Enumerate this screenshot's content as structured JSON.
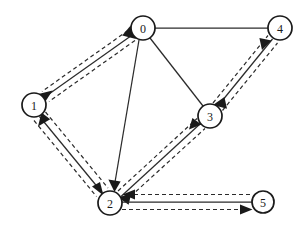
{
  "figure": {
    "type": "directed-graph-diagram",
    "background_color": "#ffffff",
    "line_color": "#2b2b2b",
    "node_fill_color": "#ffffff",
    "node_stroke_color": "#1a1a1a"
  },
  "nodes": [
    {
      "id": "0",
      "label": "0",
      "cx": 143,
      "cy": 28,
      "r": 12
    },
    {
      "id": "1",
      "label": "1",
      "cx": 34,
      "cy": 105,
      "r": 12
    },
    {
      "id": "2",
      "label": "2",
      "cx": 110,
      "cy": 203,
      "r": 12
    },
    {
      "id": "3",
      "label": "3",
      "cx": 210,
      "cy": 116,
      "r": 12
    },
    {
      "id": "4",
      "label": "4",
      "cx": 280,
      "cy": 28,
      "r": 12
    },
    {
      "id": "5",
      "label": "5",
      "cx": 263,
      "cy": 202,
      "r": 11
    }
  ],
  "edges": [
    {
      "id": "e-0-4",
      "from": "0",
      "to": "4",
      "style": "solid",
      "arrows": "none",
      "dashed_pair": false
    },
    {
      "id": "e-0-3",
      "from": "0",
      "to": "3",
      "style": "solid",
      "arrows": "none",
      "dashed_pair": false
    },
    {
      "id": "e-0-2",
      "from": "0",
      "to": "2",
      "style": "solid",
      "arrows": "to",
      "dashed_pair": false
    },
    {
      "id": "e-0-1",
      "from": "0",
      "to": "1",
      "style": "solid",
      "arrows": "both",
      "dashed_pair": true
    },
    {
      "id": "e-1-2",
      "from": "1",
      "to": "2",
      "style": "solid",
      "arrows": "both",
      "dashed_pair": true
    },
    {
      "id": "e-2-3",
      "from": "2",
      "to": "3",
      "style": "solid",
      "arrows": "both",
      "dashed_pair": true
    },
    {
      "id": "e-3-4",
      "from": "3",
      "to": "4",
      "style": "solid",
      "arrows": "both",
      "dashed_pair": true
    },
    {
      "id": "e-2-5",
      "from": "2",
      "to": "5",
      "style": "solid",
      "arrows": "both",
      "dashed_pair": true
    }
  ]
}
